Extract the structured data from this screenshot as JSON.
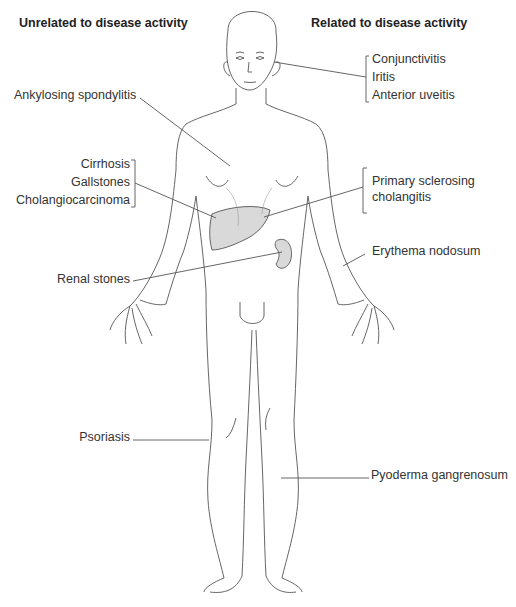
{
  "headers": {
    "left": "Unrelated to disease activity",
    "right": "Related to disease activity"
  },
  "labels_left": {
    "ankylosing": "Ankylosing spondylitis",
    "liver_group": [
      "Cirrhosis",
      "Gallstones",
      "Cholangiocarcinoma"
    ],
    "renal": "Renal stones",
    "psoriasis": "Psoriasis"
  },
  "labels_right": {
    "eye_group": [
      "Conjunctivitis",
      "Iritis",
      "Anterior uveitis"
    ],
    "psc": [
      "Primary sclerosing",
      "cholangitis"
    ],
    "erythema": "Erythema nodosum",
    "pyoderma": "Pyoderma gangrenosum"
  },
  "colors": {
    "organ_fill": "#d9d9d9",
    "line": "#555555"
  }
}
